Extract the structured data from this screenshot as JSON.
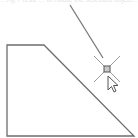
{
  "caption": {
    "text": "…ny, Press … to rotate the selected object…"
  },
  "colors": {
    "background": "#ffffff",
    "shape_stroke": "#6e6e6e",
    "guide_line": "#7a7a7a",
    "crosshair": "#9a9a9a",
    "snap_marker_fill": "#c8c8c8",
    "snap_marker_stroke": "#555555",
    "cursor_fill": "#ffffff",
    "cursor_stroke": "#555555"
  },
  "drawing": {
    "shape": {
      "type": "polygon",
      "points": "7,45 44,45 134,136 7,136"
    },
    "rotation_guide": {
      "x1": 70,
      "y1": 5,
      "x2": 103,
      "y2": 58
    },
    "snap_point": {
      "x": 107,
      "y": 69
    },
    "crosshair_arm": 13,
    "cursor": {
      "x": 108,
      "y": 76
    }
  }
}
